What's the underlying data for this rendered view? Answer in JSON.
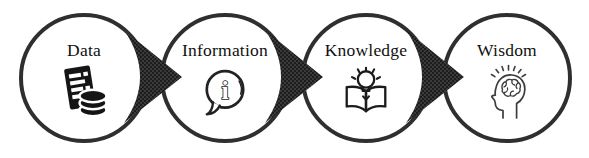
{
  "diagram": {
    "name": "data-information-knowledge-wisdom-flow",
    "stages": [
      {
        "label": "Data",
        "icon": "document-database-icon"
      },
      {
        "label": "Information",
        "icon": "info-speech-bubble-icon",
        "icon_glyph": "i"
      },
      {
        "label": "Knowledge",
        "icon": "open-book-lightbulb-icon"
      },
      {
        "label": "Wisdom",
        "icon": "head-brain-rays-icon"
      }
    ],
    "arrows": [
      {
        "name": "arrow-data-to-information"
      },
      {
        "name": "arrow-information-to-knowledge"
      },
      {
        "name": "arrow-knowledge-to-wisdom"
      }
    ],
    "colors": {
      "background": "#ffffff",
      "circle_border": "#2f2f2f",
      "arrow_fill": "#3a3a3a",
      "arrow_dot": "#191919",
      "label_text": "#101010",
      "icon_ink": "#1b1b1b"
    }
  }
}
